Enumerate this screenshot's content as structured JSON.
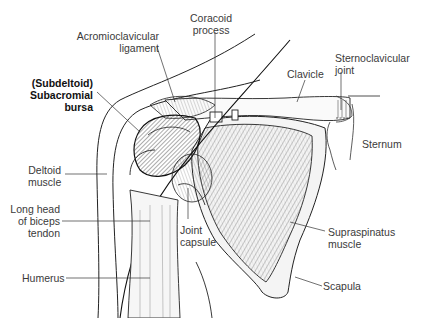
{
  "diagram": {
    "type": "anatomical-illustration",
    "highlight_label": "Subacromial bursa",
    "colors": {
      "line": "#333333",
      "text": "#3a3a3a",
      "background": "#ffffff"
    }
  },
  "labels": {
    "coracoid_process": "Coracoid\nprocess",
    "acromioclavicular_ligament": "Acromioclavicular\nligament",
    "subacromial_bursa": "(Subdeltoid)\nSubacromial\nbursa",
    "clavicle": "Clavicle",
    "sternoclavicular_joint": "Sternoclavicular\njoint",
    "sternum": "Sternum",
    "deltoid_muscle": "Deltoid\nmuscle",
    "long_head_biceps_tendon": "Long head\nof biceps\ntendon",
    "joint_capsule": "Joint\ncapsule",
    "supraspinatus_muscle": "Supraspinatus\nmuscle",
    "humerus": "Humerus",
    "scapula": "Scapula"
  }
}
